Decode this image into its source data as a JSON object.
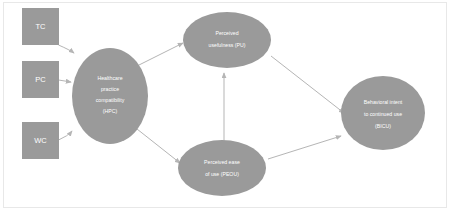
{
  "diagram": {
    "type": "path-model",
    "colors": {
      "node_fill": "#9a9a9a",
      "node_text": "#ffffff",
      "edge": "#b5b5b5",
      "background": "#ffffff",
      "frame_border": "#e8e8e8"
    },
    "nodes": [
      {
        "id": "tc",
        "shape": "rectangle",
        "label": "TC",
        "lines": [
          "TC"
        ],
        "x": 45,
        "y": 30
      },
      {
        "id": "pc",
        "shape": "rectangle",
        "label": "PC",
        "lines": [
          "PC"
        ],
        "x": 45,
        "y": 78
      },
      {
        "id": "wc",
        "shape": "rectangle",
        "label": "WC",
        "lines": [
          "WC"
        ],
        "x": 45,
        "y": 140
      },
      {
        "id": "hpc",
        "shape": "ellipse",
        "label": "Healthcare practice compatibility (HPC)",
        "lines": [
          "Healthcare",
          "practice",
          "compatibility",
          "(HPC)"
        ],
        "x": 110,
        "y": 96
      },
      {
        "id": "pu",
        "shape": "ellipse",
        "label": "Perceived usefulness (PU)",
        "lines": [
          "Perceived",
          "usefulness (PU)"
        ],
        "x": 227,
        "y": 40
      },
      {
        "id": "peou",
        "shape": "ellipse",
        "label": "Perceived ease of use (PEOU)",
        "lines": [
          "Perceived ease",
          "of use (PEOU)"
        ],
        "x": 222,
        "y": 168
      },
      {
        "id": "bicu",
        "shape": "ellipse",
        "label": "Behavioral intent to continued use (BICU)",
        "lines": [
          "Behavioral intent",
          "to continued use",
          "(BICU)"
        ],
        "x": 383,
        "y": 113
      }
    ],
    "edges": [
      {
        "id": "tc-hpc",
        "from": "TC",
        "to": "HPC"
      },
      {
        "id": "pc-hpc",
        "from": "PC",
        "to": "HPC"
      },
      {
        "id": "wc-hpc",
        "from": "WC",
        "to": "HPC"
      },
      {
        "id": "hpc-pu",
        "from": "HPC",
        "to": "PU"
      },
      {
        "id": "hpc-peou",
        "from": "HPC",
        "to": "PEOU"
      },
      {
        "id": "peou-pu",
        "from": "PEOU",
        "to": "PU"
      },
      {
        "id": "pu-bicu",
        "from": "PU",
        "to": "BICU"
      },
      {
        "id": "peou-bicu",
        "from": "PEOU",
        "to": "BICU"
      }
    ]
  }
}
